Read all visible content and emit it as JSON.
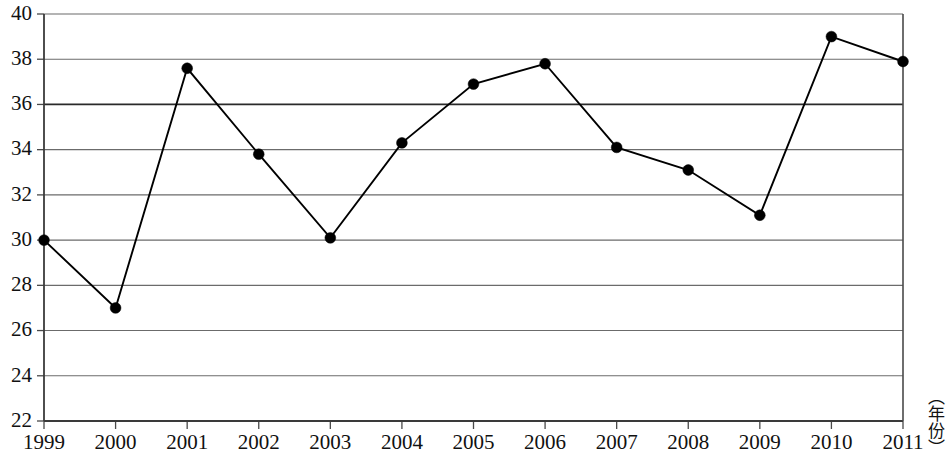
{
  "chart_data": {
    "type": "line",
    "title": "",
    "subtitle": "",
    "xlabel": "（年份）",
    "ylabel": "",
    "categories": [
      "1999",
      "2000",
      "2001",
      "2002",
      "2003",
      "2004",
      "2005",
      "2006",
      "2007",
      "2008",
      "2009",
      "2010",
      "2011"
    ],
    "values": [
      30.0,
      27.0,
      37.6,
      33.8,
      30.1,
      34.3,
      36.9,
      37.8,
      34.1,
      33.1,
      31.1,
      39.0,
      37.9
    ],
    "series": [
      {
        "name": "",
        "values": [
          30.0,
          27.0,
          37.6,
          33.8,
          30.1,
          34.3,
          36.9,
          37.8,
          34.1,
          33.1,
          31.1,
          39.0,
          37.9
        ]
      }
    ],
    "ylim": [
      22,
      40
    ],
    "ytick_values": [
      22,
      24,
      26,
      28,
      30,
      32,
      34,
      36,
      38,
      40
    ],
    "ytick_labels": [
      "22",
      "24",
      "26",
      "28",
      "30",
      "32",
      "34",
      "36",
      "38",
      "40"
    ],
    "xtick_labels": [
      "1999",
      "2000",
      "2001",
      "2002",
      "2003",
      "2004",
      "2005",
      "2006",
      "2007",
      "2008",
      "2009",
      "2010",
      "2011"
    ],
    "grid": true,
    "grid_axis": "y",
    "emphasis_gridline": 36,
    "legend": null,
    "legend_position": "none",
    "marker": "filled-circle",
    "line_color": "#000000",
    "grid_color": "#6b6b6b",
    "background_color": "#ffffff",
    "annotations": []
  },
  "axis_caption": {
    "text": "（年份）"
  }
}
